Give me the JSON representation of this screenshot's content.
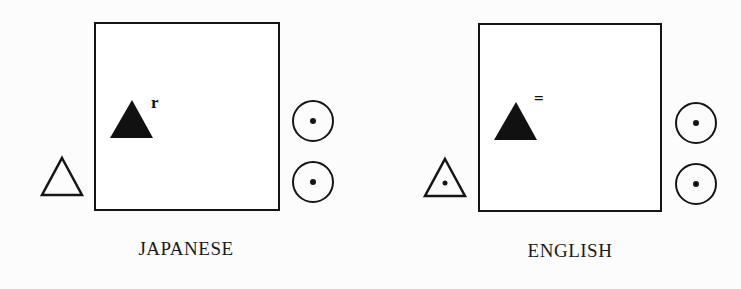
{
  "panels": [
    {
      "label": "JAPANESE",
      "superscript": "r",
      "left_triangle": "outline-triangle",
      "right_symbols": [
        "circled-dot",
        "circled-dot"
      ]
    },
    {
      "label": "ENGLISH",
      "superscript": "=",
      "left_triangle": "outline-triangle-with-dot",
      "right_symbols": [
        "circled-dot",
        "circled-dot"
      ]
    }
  ],
  "colors": {
    "stroke": "#151515",
    "background": "#fcfcfc"
  }
}
